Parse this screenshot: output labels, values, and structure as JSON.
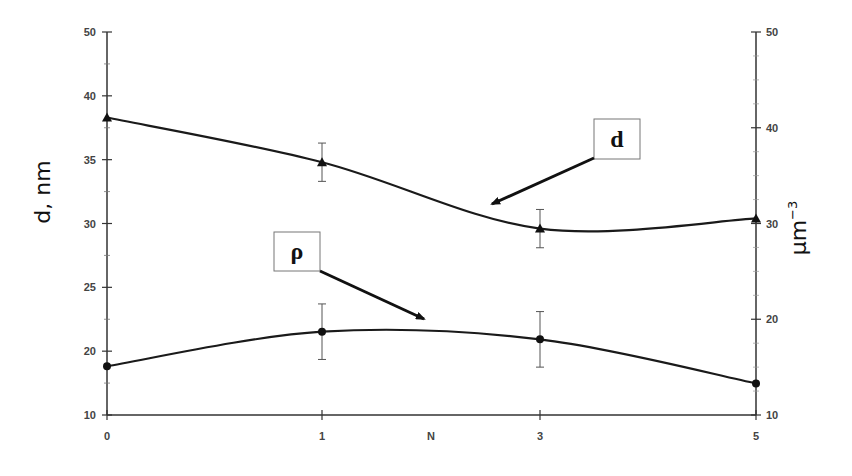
{
  "chart_data": {
    "type": "line",
    "title": "",
    "xlabel": "N",
    "ylabel_left": "d,  nm",
    "ylabel_right": "μm⁻³",
    "x": [
      0,
      1,
      3,
      5
    ],
    "x_tick_labels": [
      "0",
      "1",
      "3",
      "5"
    ],
    "y_left_tick_labels": [
      "50",
      "40",
      "35",
      "30",
      "25",
      "20",
      "10"
    ],
    "y_right_tick_labels": [
      "50",
      "40",
      "30",
      "20",
      "10"
    ],
    "y_left_range": [
      10,
      50
    ],
    "y_right_range": [
      10,
      50
    ],
    "grid": false,
    "legend": "callout boxes with arrows",
    "series": [
      {
        "name": "d",
        "axis": "left",
        "marker": "triangle",
        "values": [
          38.3,
          34.8,
          29.6,
          30.4
        ],
        "error": [
          null,
          1.5,
          1.5,
          null
        ]
      },
      {
        "name": "ρ",
        "axis": "right",
        "marker": "circle",
        "values": [
          15.1,
          18.7,
          17.9,
          13.3
        ],
        "error": [
          null,
          2.9,
          2.9,
          null
        ]
      }
    ],
    "annotations": [
      {
        "text": "d",
        "box": true,
        "arrow_to_series": "d"
      },
      {
        "text": "ρ",
        "box": true,
        "arrow_to_series": "ρ"
      }
    ]
  },
  "labels": {
    "left_axis": "d,  nm",
    "right_axis_base": "μm",
    "right_axis_sup": "−3",
    "x_axis": "N",
    "callout_d": "d",
    "callout_rho": "ρ"
  },
  "colors": {
    "line": "#1a1a1a",
    "axis": "#333333",
    "errorbar": "#555555"
  }
}
